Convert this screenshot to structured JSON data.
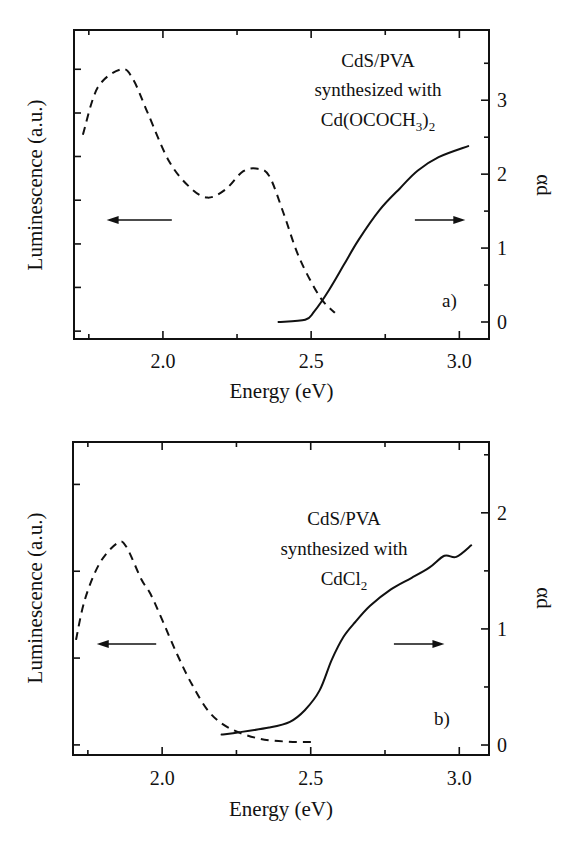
{
  "chart_data": [
    {
      "type": "line",
      "panel_label": "a)",
      "annotation": [
        "CdS/PVA",
        "synthesized with",
        "Cd(OCOCH",
        "3",
        ")",
        "2"
      ],
      "xlabel": "Energy (eV)",
      "ylabel_left": "Luminescence (a.u.)",
      "ylabel_right": "αd",
      "xlim": [
        1.7,
        3.1
      ],
      "x_ticks_major": [
        2.0,
        2.5,
        3.0
      ],
      "x_tick_labels": [
        "2.0",
        "2.5",
        "3.0"
      ],
      "x_ticks_minor": [
        1.75,
        2.25,
        2.75
      ],
      "ylim_right": [
        -0.23,
        3.95
      ],
      "y_right_ticks_major": [
        0,
        1,
        2,
        3
      ],
      "y_right_tick_labels": [
        "0",
        "1",
        "2",
        "3"
      ],
      "y_right_ticks_minor": [
        0.5,
        1.5,
        2.5,
        3.5
      ],
      "ylim_left": [
        -0.03,
        1.15
      ],
      "y_left_ticks": [
        0.0,
        0.167,
        0.333,
        0.5,
        0.667,
        0.833,
        1.0
      ],
      "grid": false,
      "series": [
        {
          "name": "Luminescence",
          "axis": "left",
          "style": "dashed",
          "x": [
            1.73,
            1.78,
            1.86,
            1.9,
            1.95,
            2.02,
            2.09,
            2.15,
            2.21,
            2.27,
            2.32,
            2.36,
            2.41,
            2.46,
            2.53,
            2.58
          ],
          "y": [
            0.75,
            0.93,
            1.0,
            0.96,
            0.83,
            0.65,
            0.55,
            0.51,
            0.54,
            0.61,
            0.62,
            0.59,
            0.44,
            0.28,
            0.13,
            0.07
          ]
        },
        {
          "name": "αd",
          "axis": "right",
          "style": "solid",
          "x": [
            2.39,
            2.48,
            2.51,
            2.56,
            2.61,
            2.66,
            2.73,
            2.8,
            2.86,
            2.93,
            3.03
          ],
          "y": [
            0.0,
            0.03,
            0.14,
            0.43,
            0.77,
            1.11,
            1.51,
            1.81,
            2.05,
            2.23,
            2.38
          ]
        }
      ],
      "arrows": [
        {
          "direction": "left",
          "meaning": "luminescence-axis",
          "x_from": 2.03,
          "x_to": 1.81,
          "y_right": 1.38
        },
        {
          "direction": "right",
          "meaning": "alpha-d-axis",
          "x_from": 2.85,
          "x_to": 3.02,
          "y_right": 1.38
        }
      ]
    },
    {
      "type": "line",
      "panel_label": "b)",
      "annotation": [
        "CdS/PVA",
        "synthesized with",
        "CdCl",
        "2"
      ],
      "xlabel": "Energy (eV)",
      "ylabel_left": "Luminescence (a.u.)",
      "ylabel_right": "αd",
      "xlim": [
        1.7,
        3.1
      ],
      "x_ticks_major": [
        2.0,
        2.5,
        3.0
      ],
      "x_tick_labels": [
        "2.0",
        "2.5",
        "3.0"
      ],
      "x_ticks_minor": [
        1.75,
        2.25,
        2.75
      ],
      "ylim_right": [
        -0.086,
        2.61
      ],
      "y_right_ticks_major": [
        0,
        1,
        2
      ],
      "y_right_tick_labels": [
        "0",
        "1",
        "2"
      ],
      "y_right_ticks_minor": [
        0.5,
        1.5,
        2.5
      ],
      "ylim_left": [
        -0.05,
        1.5
      ],
      "y_left_ticks": [
        0.0,
        0.43,
        0.86,
        1.29
      ],
      "grid": false,
      "series": [
        {
          "name": "Luminescence",
          "axis": "left",
          "style": "dashed",
          "x": [
            1.71,
            1.74,
            1.79,
            1.85,
            1.88,
            1.93,
            1.96,
            2.0,
            2.05,
            2.1,
            2.16,
            2.23,
            2.33,
            2.44,
            2.52
          ],
          "y": [
            0.52,
            0.72,
            0.9,
            1.0,
            0.98,
            0.82,
            0.75,
            0.62,
            0.45,
            0.3,
            0.16,
            0.08,
            0.03,
            0.015,
            0.015
          ]
        },
        {
          "name": "αd",
          "axis": "right",
          "style": "solid",
          "x": [
            2.2,
            2.26,
            2.36,
            2.43,
            2.48,
            2.53,
            2.57,
            2.61,
            2.65,
            2.7,
            2.77,
            2.84,
            2.9,
            2.95,
            2.99,
            3.04
          ],
          "y": [
            0.09,
            0.11,
            0.15,
            0.2,
            0.3,
            0.47,
            0.73,
            0.93,
            1.06,
            1.2,
            1.34,
            1.44,
            1.53,
            1.63,
            1.62,
            1.72
          ]
        }
      ],
      "arrows": [
        {
          "direction": "left",
          "meaning": "luminescence-axis",
          "x_from": 1.98,
          "x_to": 1.78,
          "y_right": 0.87
        },
        {
          "direction": "right",
          "meaning": "alpha-d-axis",
          "x_from": 2.78,
          "x_to": 2.95,
          "y_right": 0.87
        }
      ]
    }
  ]
}
